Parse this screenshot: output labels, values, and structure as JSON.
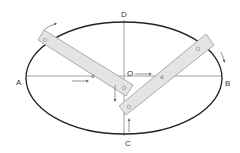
{
  "diagram": {
    "labels": {
      "A": "A",
      "B": "B",
      "C": "C",
      "D": "D",
      "O": "O"
    },
    "bar_marks": {
      "left_bar_end": "o",
      "left_bar_mid": "d",
      "left_bar_pivot": "o",
      "right_bar_end": "o",
      "right_bar_mid": "d",
      "right_bar_pivot": "o"
    },
    "colors": {
      "ellipse": "#222222",
      "axes": "#888888",
      "bar_fill": "#e4e4e4",
      "bar_stroke": "#999999",
      "arrow": "#666666"
    }
  }
}
